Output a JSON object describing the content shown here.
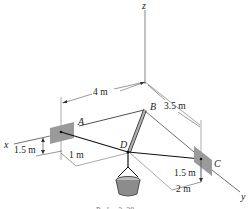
{
  "figure": {
    "axes": {
      "x": "x",
      "y": "y",
      "z": "z"
    },
    "points": {
      "A": "A",
      "B": "B",
      "C": "C",
      "D": "D"
    },
    "dimensions": {
      "AB_x": "4 m",
      "BC_y": "3.5 m",
      "A_height": "1.5 m",
      "A_offset": "1 m",
      "C_height": "1.5 m",
      "C_offset": "2 m"
    },
    "caption_partial": "Probs. 3–38"
  },
  "colors": {
    "line": "#1a1a1a",
    "plate": "#9a9a9a",
    "strut": "#b0b0b0",
    "bucket": "#8c8c8c"
  }
}
